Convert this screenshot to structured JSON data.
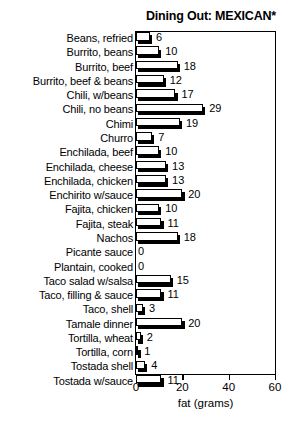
{
  "chart_data": {
    "type": "bar",
    "orientation": "horizontal",
    "title": "Dining Out: MEXICAN*",
    "xlabel": "fat (grams)",
    "ylabel": "",
    "xlim": [
      0,
      60
    ],
    "xticks": [
      0,
      20,
      40,
      60
    ],
    "xtick_labels": [
      "0",
      "20",
      "40",
      "60"
    ],
    "grid": false,
    "legend": false,
    "value_labels": true,
    "bar_style": "white-fill-black-outline-with-drop-shadow",
    "categories": [
      "Beans, refried",
      "Burrito, beans",
      "Burrito, beef",
      "Burrito, beef & beans",
      "Chili, w/beans",
      "Chili, no beans",
      "Chimi",
      "Churro",
      "Enchilada, beef",
      "Enchilada, cheese",
      "Enchilada, chicken",
      "Enchirito w/sauce",
      "Fajita, chicken",
      "Fajita, steak",
      "Nachos",
      "Picante sauce",
      "Plantain, cooked",
      "Taco salad w/salsa",
      "Taco, filling & sauce",
      "Taco, shell",
      "Tamale dinner",
      "Tortilla, wheat",
      "Tortilla, corn",
      "Tostada shell",
      "Tostada w/sauce"
    ],
    "values": [
      6,
      10,
      18,
      12,
      17,
      29,
      19,
      7,
      10,
      13,
      13,
      20,
      10,
      11,
      18,
      0,
      0,
      15,
      11,
      3,
      20,
      2,
      1,
      4,
      11
    ],
    "value_text": [
      "6",
      "10",
      "18",
      "12",
      "17",
      "29",
      "19",
      "7",
      "10",
      "13",
      "13",
      "20",
      "10",
      "11",
      "18",
      "0",
      "0",
      "15",
      "11",
      "3",
      "20",
      "2",
      "1",
      "4",
      "11"
    ],
    "colors": {
      "bar_fill": "#ffffff",
      "bar_outline": "#000000",
      "bar_shadow": "#000000",
      "axis": "#000000",
      "text": "#000000",
      "background": "#ffffff"
    }
  }
}
